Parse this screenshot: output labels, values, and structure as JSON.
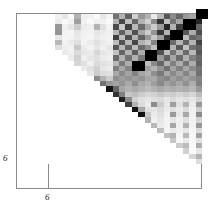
{
  "figure": {
    "title": "",
    "type": "matrix-heatmap"
  },
  "axes": {
    "x_tick_label": "6",
    "y_tick_label": "6",
    "x_tick_value": 6,
    "y_tick_value": 6,
    "frame_color": "#8a8a8a",
    "background": "#ffffff"
  },
  "chart_data": {
    "type": "heatmap",
    "title": "",
    "xlabel": "",
    "ylabel": "",
    "colormap": "gray_reversed",
    "value_range": [
      0,
      1
    ],
    "note": "0 = white, 1 = black. Row 0 is the TOP row of the plot.",
    "n_rows": 29,
    "n_cols": 29,
    "xticks": [
      6
    ],
    "xticklabels": [
      "6"
    ],
    "yticks": [
      6
    ],
    "yticklabels": [
      "6"
    ],
    "grid": false,
    "legend": "none",
    "matrix": [
      [
        0.0,
        0.0,
        0.0,
        0.0,
        0.0,
        0.0,
        0.05,
        0.1,
        0.02,
        0.3,
        0.06,
        0.05,
        0.02,
        0.1,
        0.04,
        0.55,
        0.3,
        0.62,
        0.18,
        0.4,
        0.3,
        0.08,
        0.28,
        0.66,
        0.45,
        0.6,
        0.4,
        0.35,
        0.97
      ],
      [
        0.0,
        0.0,
        0.0,
        0.0,
        0.0,
        0.0,
        0.08,
        0.02,
        0.05,
        0.38,
        0.05,
        0.02,
        0.06,
        0.05,
        0.02,
        0.3,
        0.72,
        0.25,
        0.6,
        0.3,
        0.18,
        0.45,
        0.8,
        0.25,
        0.55,
        0.35,
        0.68,
        0.3,
        0.85
      ],
      [
        0.0,
        0.0,
        0.0,
        0.0,
        0.0,
        0.0,
        0.4,
        0.06,
        0.1,
        0.2,
        0.08,
        0.06,
        0.3,
        0.12,
        0.05,
        0.7,
        0.22,
        0.75,
        0.28,
        0.58,
        0.35,
        0.2,
        0.4,
        0.85,
        0.3,
        0.75,
        0.22,
        0.58,
        0.6
      ],
      [
        0.0,
        0.0,
        0.0,
        0.0,
        0.0,
        0.0,
        0.42,
        0.05,
        0.04,
        0.1,
        0.06,
        0.05,
        0.1,
        0.08,
        0.06,
        0.28,
        0.62,
        0.3,
        0.68,
        0.35,
        0.2,
        0.42,
        0.78,
        0.3,
        0.62,
        0.28,
        0.66,
        0.32,
        0.7
      ],
      [
        0.0,
        0.0,
        0.0,
        0.0,
        0.0,
        0.0,
        0.1,
        0.04,
        0.05,
        0.08,
        0.05,
        0.04,
        0.08,
        0.06,
        0.05,
        0.75,
        0.25,
        0.7,
        0.3,
        0.62,
        0.4,
        0.22,
        0.38,
        0.8,
        0.32,
        0.7,
        0.26,
        0.6,
        0.55
      ],
      [
        0.0,
        0.0,
        0.0,
        0.0,
        0.0,
        0.0,
        0.28,
        0.05,
        0.08,
        0.12,
        0.05,
        0.08,
        0.12,
        0.08,
        0.05,
        0.26,
        0.68,
        0.28,
        0.72,
        0.3,
        0.22,
        0.48,
        0.72,
        0.28,
        0.58,
        0.3,
        0.62,
        0.3,
        0.74
      ],
      [
        0.0,
        0.0,
        0.0,
        0.0,
        0.0,
        0.0,
        0.12,
        0.06,
        0.05,
        0.22,
        0.08,
        0.05,
        0.1,
        0.06,
        0.1,
        0.66,
        0.28,
        0.62,
        0.26,
        0.58,
        0.45,
        0.25,
        0.35,
        0.7,
        0.3,
        0.66,
        0.24,
        0.56,
        0.62
      ],
      [
        0.0,
        0.0,
        0.0,
        0.0,
        0.0,
        0.0,
        0.3,
        0.08,
        0.06,
        0.14,
        0.1,
        0.08,
        0.16,
        0.1,
        0.08,
        0.24,
        0.6,
        0.3,
        0.64,
        0.32,
        0.24,
        0.5,
        0.68,
        0.26,
        0.55,
        0.3,
        0.58,
        0.28,
        0.66
      ],
      [
        0.0,
        0.0,
        0.0,
        0.0,
        0.0,
        0.0,
        0.1,
        0.05,
        0.08,
        0.18,
        0.06,
        0.1,
        0.12,
        0.08,
        0.06,
        0.58,
        0.3,
        0.55,
        0.3,
        0.52,
        0.42,
        0.28,
        0.4,
        0.62,
        0.35,
        0.58,
        0.3,
        0.5,
        0.58
      ],
      [
        0.0,
        0.0,
        0.0,
        0.0,
        0.0,
        0.0,
        0.26,
        0.1,
        0.06,
        0.16,
        0.12,
        0.06,
        0.14,
        0.12,
        0.1,
        0.28,
        0.52,
        0.32,
        0.56,
        0.34,
        0.26,
        0.46,
        0.6,
        0.3,
        0.5,
        0.32,
        0.54,
        0.32,
        0.62
      ],
      [
        0.0,
        0.0,
        0.0,
        0.0,
        0.0,
        0.0,
        0.14,
        0.06,
        0.1,
        0.2,
        0.08,
        0.12,
        0.18,
        0.1,
        0.08,
        0.5,
        0.34,
        0.48,
        0.34,
        0.46,
        0.38,
        0.3,
        0.42,
        0.56,
        0.36,
        0.5,
        0.34,
        0.46,
        0.54
      ],
      [
        0.0,
        0.0,
        0.0,
        0.0,
        0.0,
        0.0,
        0.32,
        0.12,
        0.08,
        0.22,
        0.14,
        0.1,
        0.2,
        0.14,
        0.12,
        0.34,
        0.46,
        0.36,
        0.5,
        0.36,
        0.3,
        0.44,
        0.52,
        0.34,
        0.46,
        0.36,
        0.48,
        0.34,
        0.56
      ],
      [
        0.0,
        0.0,
        0.0,
        0.0,
        0.0,
        0.0,
        0.18,
        0.1,
        0.12,
        0.24,
        0.12,
        0.14,
        0.45,
        0.3,
        0.2,
        0.44,
        0.38,
        0.42,
        0.38,
        0.42,
        0.35,
        0.34,
        0.44,
        0.48,
        0.38,
        0.44,
        0.36,
        0.42,
        0.48
      ],
      [
        0.0,
        0.0,
        0.0,
        0.0,
        0.0,
        0.0,
        0.22,
        0.14,
        0.1,
        0.26,
        0.16,
        0.18,
        0.3,
        0.55,
        0.4,
        0.36,
        0.42,
        0.34,
        0.44,
        0.34,
        0.3,
        0.38,
        0.46,
        0.36,
        0.42,
        0.34,
        0.44,
        0.32,
        0.5
      ],
      [
        0.0,
        0.0,
        0.0,
        0.0,
        0.0,
        0.0,
        0.16,
        0.12,
        0.14,
        0.28,
        0.2,
        0.22,
        0.35,
        0.45,
        0.92,
        0.6,
        0.35,
        0.3,
        0.34,
        0.3,
        0.26,
        0.3,
        0.34,
        0.3,
        0.32,
        0.3,
        0.32,
        0.28,
        0.4
      ],
      [
        0.0,
        0.0,
        0.0,
        0.0,
        0.0,
        0.0,
        0.2,
        0.16,
        0.12,
        0.3,
        0.24,
        0.26,
        0.4,
        0.55,
        0.65,
        0.8,
        0.5,
        0.22,
        0.26,
        0.2,
        0.16,
        0.18,
        0.22,
        0.18,
        0.2,
        0.16,
        0.2,
        0.16,
        0.26
      ],
      [
        0.0,
        0.0,
        0.0,
        0.0,
        0.0,
        0.0,
        0.24,
        0.18,
        0.16,
        0.32,
        0.28,
        0.3,
        0.45,
        0.4,
        0.36,
        0.5,
        0.88,
        0.45,
        0.18,
        0.12,
        0.1,
        0.12,
        0.14,
        0.1,
        0.14,
        0.1,
        0.12,
        0.1,
        0.18
      ],
      [
        0.0,
        0.0,
        0.0,
        0.0,
        0.0,
        0.0,
        0.18,
        0.14,
        0.18,
        0.26,
        0.22,
        0.24,
        0.3,
        0.28,
        0.24,
        0.26,
        0.42,
        0.75,
        0.3,
        0.14,
        0.08,
        0.45,
        0.2,
        0.1,
        0.38,
        0.12,
        0.3,
        0.08,
        0.4
      ],
      [
        0.0,
        0.0,
        0.0,
        0.0,
        0.0,
        0.0,
        0.14,
        0.1,
        0.12,
        0.2,
        0.16,
        0.18,
        0.22,
        0.2,
        0.18,
        0.2,
        0.22,
        0.3,
        0.92,
        0.35,
        0.12,
        0.1,
        0.14,
        0.08,
        0.12,
        0.08,
        0.14,
        0.06,
        0.2
      ],
      [
        0.0,
        0.0,
        0.0,
        0.0,
        0.0,
        0.0,
        0.12,
        0.08,
        0.1,
        0.16,
        0.12,
        0.14,
        0.18,
        0.16,
        0.14,
        0.16,
        0.14,
        0.16,
        0.3,
        0.94,
        0.22,
        0.08,
        0.12,
        0.06,
        0.4,
        0.1,
        0.35,
        0.06,
        0.45
      ],
      [
        0.0,
        0.0,
        0.0,
        0.0,
        0.0,
        0.0,
        0.1,
        0.06,
        0.08,
        0.14,
        0.1,
        0.12,
        0.14,
        0.12,
        0.12,
        0.12,
        0.12,
        0.1,
        0.14,
        0.22,
        0.3,
        0.06,
        0.1,
        0.05,
        0.1,
        0.06,
        0.12,
        0.05,
        0.18
      ],
      [
        0.0,
        0.0,
        0.0,
        0.0,
        0.0,
        0.0,
        0.3,
        0.05,
        0.06,
        0.12,
        0.08,
        0.1,
        0.12,
        0.1,
        0.1,
        0.1,
        0.1,
        0.4,
        0.1,
        0.08,
        0.06,
        0.28,
        0.08,
        0.05,
        0.35,
        0.06,
        0.3,
        0.05,
        0.4
      ],
      [
        0.0,
        0.0,
        0.0,
        0.0,
        0.0,
        0.0,
        0.08,
        0.04,
        0.05,
        0.1,
        0.06,
        0.08,
        0.1,
        0.08,
        0.08,
        0.08,
        0.08,
        0.12,
        0.08,
        0.06,
        0.05,
        0.08,
        0.26,
        0.04,
        0.08,
        0.05,
        0.1,
        0.04,
        0.14
      ],
      [
        0.0,
        0.0,
        0.0,
        0.0,
        0.0,
        0.0,
        0.25,
        0.03,
        0.04,
        0.08,
        0.05,
        0.06,
        0.08,
        0.06,
        0.06,
        0.06,
        0.06,
        0.3,
        0.06,
        0.35,
        0.04,
        0.3,
        0.06,
        0.24,
        0.3,
        0.04,
        0.28,
        0.03,
        0.36
      ],
      [
        0.0,
        0.0,
        0.0,
        0.0,
        0.0,
        0.0,
        0.06,
        0.03,
        0.03,
        0.06,
        0.04,
        0.05,
        0.06,
        0.05,
        0.05,
        0.05,
        0.05,
        0.08,
        0.05,
        0.08,
        0.03,
        0.06,
        0.04,
        0.06,
        0.22,
        0.03,
        0.08,
        0.03,
        0.12
      ],
      [
        0.0,
        0.0,
        0.0,
        0.0,
        0.0,
        0.0,
        0.2,
        0.02,
        0.03,
        0.05,
        0.03,
        0.04,
        0.05,
        0.04,
        0.04,
        0.04,
        0.04,
        0.25,
        0.04,
        0.3,
        0.03,
        0.26,
        0.03,
        0.25,
        0.04,
        0.2,
        0.26,
        0.02,
        0.32
      ],
      [
        0.0,
        0.0,
        0.0,
        0.0,
        0.0,
        0.0,
        0.05,
        0.02,
        0.02,
        0.04,
        0.03,
        0.03,
        0.04,
        0.03,
        0.03,
        0.03,
        0.03,
        0.06,
        0.03,
        0.06,
        0.02,
        0.05,
        0.02,
        0.05,
        0.02,
        0.04,
        0.18,
        0.02,
        0.1
      ],
      [
        0.0,
        0.0,
        0.0,
        0.0,
        0.0,
        0.0,
        0.18,
        0.02,
        0.02,
        0.03,
        0.02,
        0.03,
        0.03,
        0.03,
        0.02,
        0.03,
        0.03,
        0.22,
        0.02,
        0.28,
        0.02,
        0.24,
        0.02,
        0.22,
        0.02,
        0.22,
        0.03,
        0.16,
        0.3
      ],
      [
        0.0,
        0.0,
        0.0,
        0.0,
        0.0,
        0.0,
        0.04,
        0.01,
        0.02,
        0.03,
        0.02,
        0.02,
        0.03,
        0.02,
        0.02,
        0.02,
        0.02,
        0.05,
        0.02,
        0.05,
        0.02,
        0.04,
        0.02,
        0.04,
        0.02,
        0.04,
        0.02,
        0.03,
        0.14
      ]
    ],
    "diagonal_blocks": [
      {
        "start": 0,
        "size": 2,
        "value": 1.0
      },
      {
        "start": 2,
        "size": 2,
        "value": 1.0
      },
      {
        "start": 4,
        "size": 2,
        "value": 1.0
      },
      {
        "start": 6,
        "size": 2,
        "value": 1.0
      },
      {
        "start": 8,
        "size": 1,
        "value": 1.0
      },
      {
        "start": 9,
        "size": 1,
        "value": 1.0
      }
    ]
  },
  "geometry": {
    "plot_left": 16,
    "plot_top": 13,
    "plot_right": 202,
    "plot_bottom": 189,
    "inner_left": 48,
    "inner_bottom": 163,
    "cell_size": 5.31
  }
}
